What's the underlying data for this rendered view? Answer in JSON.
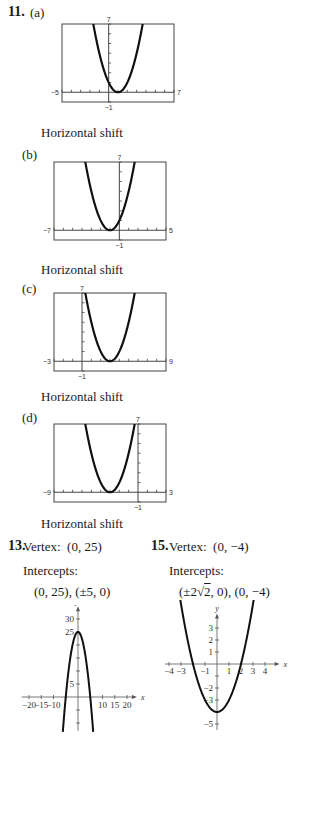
{
  "problem11": {
    "number": "11.",
    "parts": [
      {
        "label": "(a)",
        "caption": "Horizontal shift"
      },
      {
        "label": "(b)",
        "caption": "Horizontal shift"
      },
      {
        "label": "(c)",
        "caption": "Horizontal shift"
      },
      {
        "label": "(d)",
        "caption": "Horizontal shift"
      }
    ]
  },
  "problem13": {
    "number": "13.",
    "vertex_label": "Vertex:",
    "vertex_value": "(0, 25)",
    "intercepts_label": "Intercepts:",
    "intercepts_value": "(0, 25), (±5, 0)"
  },
  "problem15": {
    "number": "15.",
    "vertex_label": "Vertex:",
    "vertex_value": "(0, −4)",
    "intercepts_label": "Intercepts:",
    "intercepts_value_pre": "(±2",
    "intercepts_value_sqrt": "2",
    "intercepts_value_post": ", 0), (0, −4)"
  },
  "chart_data": [
    {
      "type": "line",
      "title": "11(a)",
      "xlim": [
        -5,
        7
      ],
      "ylim": [
        -1,
        7
      ],
      "window_labels": {
        "xmin": "−5",
        "xmax": "7",
        "ymin": "−1",
        "ymax": "7"
      },
      "function": "y = (x - 1)^2",
      "vertex": [
        1,
        0
      ]
    },
    {
      "type": "line",
      "title": "11(b)",
      "xlim": [
        -7,
        5
      ],
      "ylim": [
        -1,
        7
      ],
      "window_labels": {
        "xmin": "−7",
        "xmax": "5",
        "ymin": "−1",
        "ymax": "7"
      },
      "function": "y = (x + 1)^2",
      "vertex": [
        -1,
        0
      ]
    },
    {
      "type": "line",
      "title": "11(c)",
      "xlim": [
        -3,
        9
      ],
      "ylim": [
        -1,
        7
      ],
      "window_labels": {
        "xmin": "−3",
        "xmax": "9",
        "ymin": "−1",
        "ymax": "7"
      },
      "function": "y = (x - 3)^2",
      "vertex": [
        3,
        0
      ]
    },
    {
      "type": "line",
      "title": "11(d)",
      "xlim": [
        -9,
        3
      ],
      "ylim": [
        -1,
        7
      ],
      "window_labels": {
        "xmin": "−9",
        "xmax": "3",
        "ymin": "−1",
        "ymax": "7"
      },
      "function": "y = (x + 3)^2",
      "vertex": [
        -3,
        0
      ]
    },
    {
      "type": "line",
      "title": "13",
      "xlabel": "x",
      "ylabel": "y",
      "xlim": [
        -20,
        20
      ],
      "ylim": [
        -12,
        32
      ],
      "x_ticks": [
        "−20",
        "−15",
        "−10",
        "10",
        "15",
        "20"
      ],
      "y_ticks": [
        "5",
        "25",
        "30"
      ],
      "function": "y = 25 - x^2",
      "vertex": [
        0,
        25
      ]
    },
    {
      "type": "line",
      "title": "15",
      "xlabel": "x",
      "ylabel": "y",
      "xlim": [
        -4,
        4
      ],
      "ylim": [
        -5,
        3
      ],
      "x_ticks": [
        "−4",
        "−3",
        "−1",
        "1",
        "2",
        "3",
        "4"
      ],
      "y_ticks": [
        "3",
        "2",
        "1",
        "−2",
        "−3",
        "−5"
      ],
      "function": "y = x^2 - 4",
      "vertex": [
        0,
        -4
      ]
    }
  ]
}
